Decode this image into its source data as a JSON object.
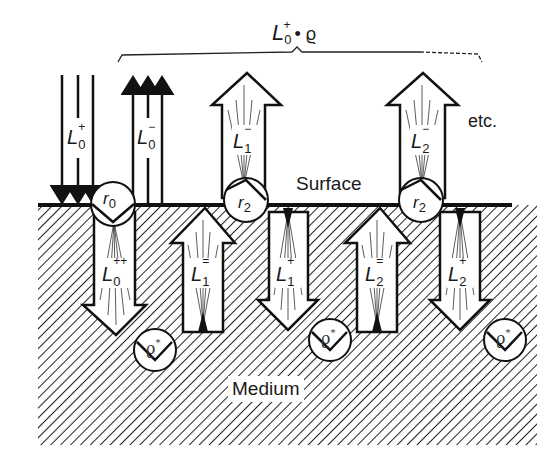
{
  "figure": {
    "top_label": "L₀⁺ · ϱ",
    "top_label_parts": {
      "L": "L",
      "sub": "0",
      "sup": "+",
      "rest": "• ϱ"
    },
    "surface_label": "Surface",
    "medium_label": "Medium",
    "etc_label": "etc.",
    "incident": {
      "L": "L",
      "sub": "0",
      "sup": "+"
    },
    "reflected": {
      "L": "L",
      "sub": "0",
      "sup": "−"
    },
    "r0": {
      "r": "r",
      "sub": "0"
    },
    "r2a": {
      "r": "r",
      "sub": "2"
    },
    "r2b": {
      "r": "r",
      "sub": "2"
    },
    "L0pp": {
      "L": "L",
      "sub": "0",
      "sup": "++"
    },
    "L1eq": {
      "L": "L",
      "sub": "1",
      "sup": "="
    },
    "L1m": {
      "L": "L",
      "sub": "1",
      "sup": "−"
    },
    "L1p": {
      "L": "L",
      "sub": "1",
      "sup": "+"
    },
    "L2eq": {
      "L": "L",
      "sub": "2",
      "sup": "="
    },
    "L2m": {
      "L": "L",
      "sub": "2",
      "sup": "−"
    },
    "L2p": {
      "L": "L",
      "sub": "2",
      "sup": "+"
    },
    "rho1": {
      "rho": "ϱ",
      "sup": "*"
    },
    "rho2": {
      "rho": "ϱ",
      "sup": "*"
    },
    "rho3": {
      "rho": "ϱ",
      "sup": "*"
    },
    "colors": {
      "ink": "#1a1a1a",
      "paper": "#ffffff"
    }
  }
}
